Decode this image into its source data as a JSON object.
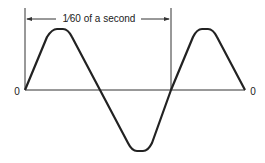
{
  "diagram": {
    "period_label": "1⁄60 of a second",
    "origin_label_left": "0",
    "origin_label_right": "0",
    "colors": {
      "line": "#222222",
      "background": "#ffffff"
    }
  }
}
